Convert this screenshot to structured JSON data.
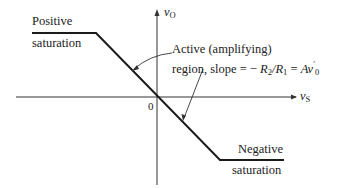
{
  "diagram": {
    "axes": {
      "y_label_var": "v",
      "y_label_sub": "O",
      "x_label_var": "v",
      "x_label_sub": "S",
      "origin_label": "0"
    },
    "labels": {
      "positive_line1": "Positive",
      "positive_line2": "saturation",
      "negative_line1": "Negative",
      "negative_line2": "saturation",
      "active_line1": "Active (amplifying)",
      "active_line2_prefix": "region, slope = − ",
      "active_r2": "R",
      "active_r2_sub": "2",
      "active_slash": "/",
      "active_r1": "R",
      "active_r1_sub": "1",
      "active_eq": " = ",
      "active_gain": "Av",
      "active_gain_sub": "0",
      "active_gain_prime": "′"
    },
    "colors": {
      "line": "#1a1a1a",
      "axis": "#333333"
    }
  }
}
